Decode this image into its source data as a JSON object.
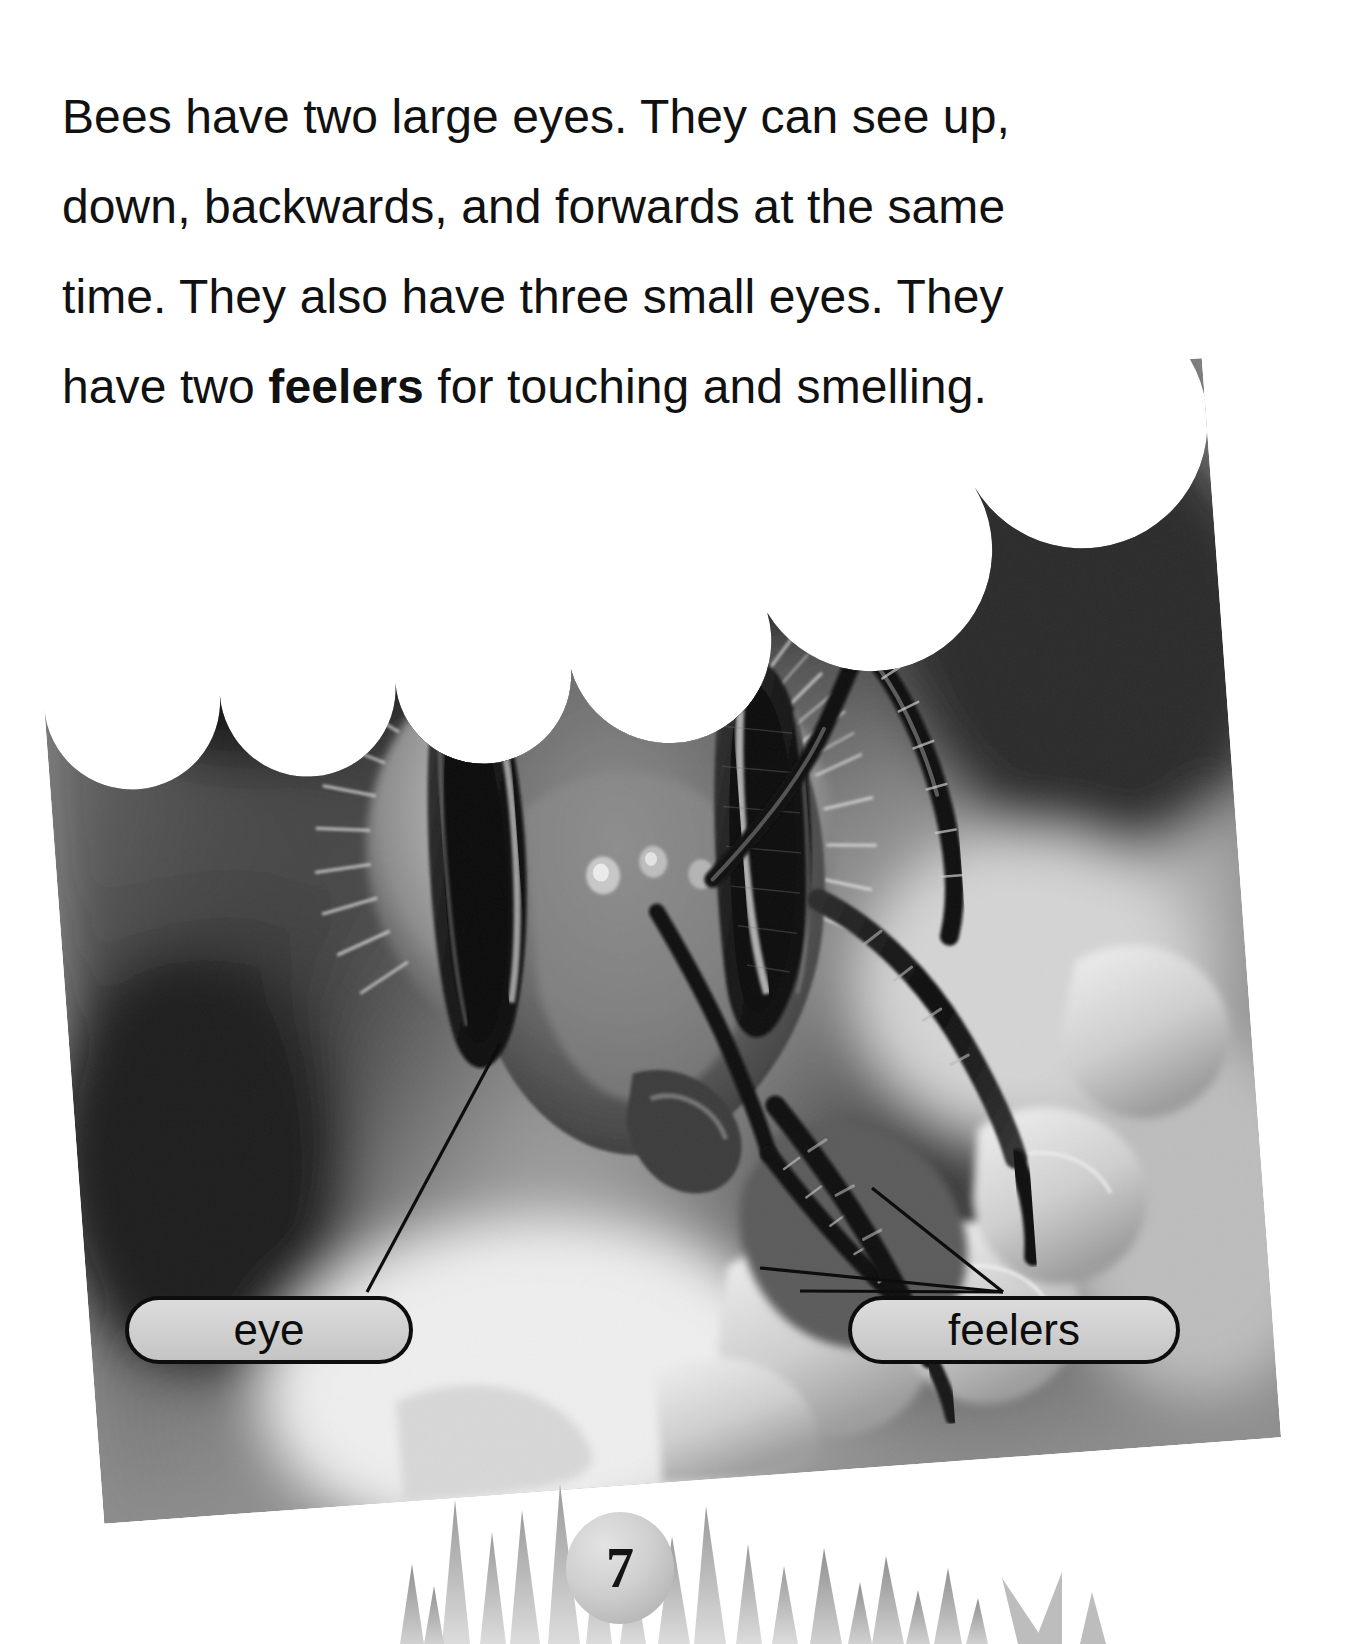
{
  "page": {
    "number": "7",
    "background_color": "#ffffff",
    "text_color": "#111111"
  },
  "body_text": {
    "full": "Bees have two large eyes. They can see up, down, backwards, and forwards at the same time. They also have three small eyes. They have two feelers for touching and smelling.",
    "segments": [
      {
        "text": "Bees have two large eyes. They can see up, down, backwards, and forwards at the same time. They also have three small eyes. They have two ",
        "bold": false
      },
      {
        "text": "feelers",
        "bold": true
      },
      {
        "text": " for touching and smelling.",
        "bold": false
      }
    ],
    "lines": [
      "Bees have two large eyes. They can see",
      "up, down, backwards, and forwards at",
      "the same time. They also have three",
      "small eyes. They have two feelers for",
      "touching and smelling."
    ],
    "bold_word": "feelers"
  },
  "photograph": {
    "subject": "close-up black-and-white photograph of a honey bee head on a flower",
    "style": "grayscale",
    "edge": "scalloped top edge",
    "rotation_degrees": -4.2
  },
  "callouts": [
    {
      "id": "eye",
      "label": "eye",
      "fill_color": "#d2d2d2",
      "border_color": "#0d0d0d"
    },
    {
      "id": "feelers",
      "label": "feelers",
      "fill_color": "#d2d2d2",
      "border_color": "#0d0d0d"
    }
  ],
  "decorations": {
    "grass": "grass-blades-silhouette",
    "page_badge_color": "#cfcfcf"
  }
}
